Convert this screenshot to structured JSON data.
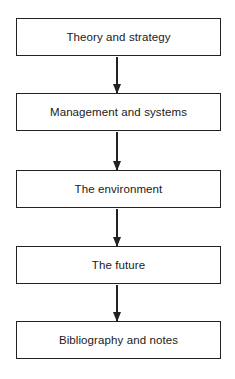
{
  "diagram": {
    "type": "flowchart",
    "direction": "top-to-bottom",
    "nodes": [
      {
        "id": "n1",
        "label": "Theory and strategy"
      },
      {
        "id": "n2",
        "label": "Management and systems"
      },
      {
        "id": "n3",
        "label": "The environment"
      },
      {
        "id": "n4",
        "label": "The future"
      },
      {
        "id": "n5",
        "label": "Bibliography and notes"
      }
    ],
    "edges": [
      {
        "from": "n1",
        "to": "n2"
      },
      {
        "from": "n2",
        "to": "n3"
      },
      {
        "from": "n3",
        "to": "n4"
      },
      {
        "from": "n4",
        "to": "n5"
      }
    ]
  }
}
